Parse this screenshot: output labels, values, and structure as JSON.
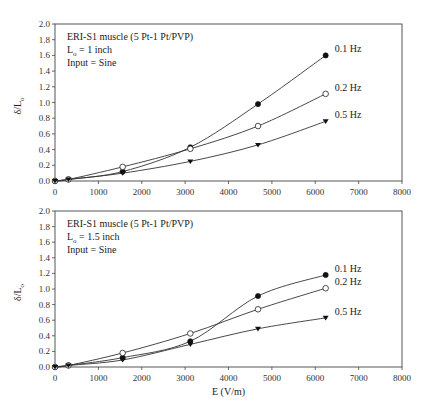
{
  "chart_data": [
    {
      "type": "line",
      "title": "",
      "annotation": [
        "ERI-S1 muscle (5 Pt-1 Pt/PVP)",
        "L_o = 1 inch",
        "Input = Sine"
      ],
      "xlabel": "",
      "ylabel": "δ/L_o",
      "xlim": [
        0,
        8000
      ],
      "ylim": [
        0,
        2.0
      ],
      "xticks": [
        0,
        1000,
        2000,
        3000,
        4000,
        5000,
        6000,
        7000,
        8000
      ],
      "yticks": [
        0.0,
        0.2,
        0.4,
        0.6,
        0.8,
        1.0,
        1.2,
        1.4,
        1.6,
        1.8,
        2.0
      ],
      "grid": false,
      "legend_position": "inline labels at line ends",
      "x": [
        0,
        310,
        1560,
        3120,
        4680,
        6240
      ],
      "series": [
        {
          "name": "0.1 Hz",
          "marker": "filled-circle",
          "values": [
            0.0,
            0.02,
            0.12,
            0.43,
            0.98,
            1.6
          ]
        },
        {
          "name": "0.2 Hz",
          "marker": "open-circle",
          "values": [
            0.0,
            0.02,
            0.18,
            0.41,
            0.7,
            1.11
          ]
        },
        {
          "name": "0.5 Hz",
          "marker": "filled-triangle-down",
          "values": [
            0.0,
            0.02,
            0.1,
            0.25,
            0.46,
            0.76
          ]
        }
      ]
    },
    {
      "type": "line",
      "title": "",
      "annotation": [
        "ERI-S1 muscle (5 Pt-1 Pt/PVP)",
        "L_o = 1.5 inch",
        "Input = Sine"
      ],
      "xlabel": "E (V/m)",
      "ylabel": "δ/L_o",
      "xlim": [
        0,
        8000
      ],
      "ylim": [
        0,
        2.0
      ],
      "xticks": [
        0,
        1000,
        2000,
        3000,
        4000,
        5000,
        6000,
        7000,
        8000
      ],
      "yticks": [
        0.0,
        0.2,
        0.4,
        0.6,
        0.8,
        1.0,
        1.2,
        1.4,
        1.6,
        1.8,
        2.0
      ],
      "grid": false,
      "legend_position": "inline labels at line ends",
      "x": [
        0,
        310,
        1560,
        3120,
        4680,
        6240
      ],
      "series": [
        {
          "name": "0.1 Hz",
          "marker": "filled-circle",
          "values": [
            0.0,
            0.02,
            0.12,
            0.33,
            0.91,
            1.18
          ]
        },
        {
          "name": "0.2 Hz",
          "marker": "open-circle",
          "values": [
            0.0,
            0.02,
            0.18,
            0.43,
            0.74,
            1.01
          ]
        },
        {
          "name": "0.5 Hz",
          "marker": "filled-triangle-down",
          "values": [
            0.0,
            0.02,
            0.09,
            0.29,
            0.49,
            0.63
          ]
        }
      ]
    }
  ],
  "labels": {
    "top": {
      "line1": "ERI-S1 muscle (5 Pt-1 Pt/PVP)",
      "line2_main": "L",
      "line2_sub": "o",
      "line2_rest": " = 1 inch",
      "line3": "Input = Sine",
      "ylabel_main": "δ/L",
      "ylabel_sub": "o"
    },
    "bottom": {
      "line1": "ERI-S1 muscle (5 Pt-1 Pt/PVP)",
      "line2_main": "L",
      "line2_sub": "o",
      "line2_rest": " = 1.5 inch",
      "line3": "Input = Sine",
      "ylabel_main": "δ/L",
      "ylabel_sub": "o",
      "xlabel": "E (V/m)"
    }
  }
}
